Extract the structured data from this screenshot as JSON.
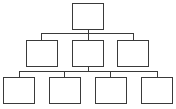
{
  "diagram": {
    "type": "org-chart",
    "stroke_color": "#3a3a3a",
    "background": "#ffffff",
    "levels": 3,
    "nodes": [
      {
        "id": "root",
        "label": "",
        "level": 0
      },
      {
        "id": "mid-1",
        "label": "",
        "level": 1,
        "parent": "root"
      },
      {
        "id": "mid-2",
        "label": "",
        "level": 1,
        "parent": "root"
      },
      {
        "id": "mid-3",
        "label": "",
        "level": 1,
        "parent": "root"
      },
      {
        "id": "leaf-1",
        "label": "",
        "level": 2
      },
      {
        "id": "leaf-2",
        "label": "",
        "level": 2
      },
      {
        "id": "leaf-3",
        "label": "",
        "level": 2
      },
      {
        "id": "leaf-4",
        "label": "",
        "level": 2
      }
    ]
  }
}
